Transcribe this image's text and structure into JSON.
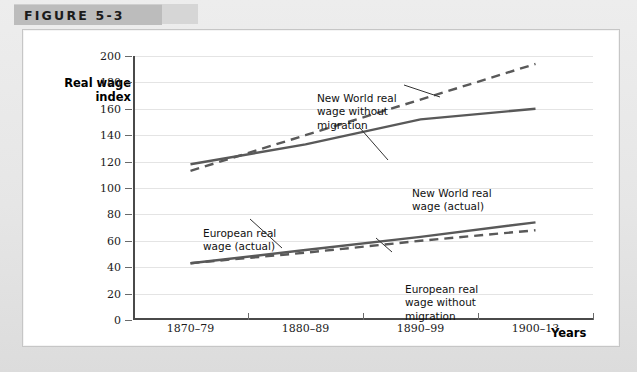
{
  "figure": {
    "label": "FIGURE 5-3"
  },
  "chart_data": {
    "type": "line",
    "title": "",
    "xlabel": "Years",
    "ylabel": "Real wage index",
    "ylabel_line1": "Real wage",
    "ylabel_line2": "index",
    "categories": [
      "1870–79",
      "1880–89",
      "1890–99",
      "1900–13"
    ],
    "ylim": [
      0,
      200
    ],
    "yticks": [
      0,
      20,
      40,
      60,
      80,
      100,
      120,
      140,
      160,
      180,
      200
    ],
    "grid": true,
    "legend": "annotations",
    "series": [
      {
        "name": "New World real wage without migration",
        "style": "dashed",
        "color": "#595959",
        "values": [
          113,
          140,
          167,
          194
        ]
      },
      {
        "name": "New World real wage (actual)",
        "style": "solid",
        "color": "#595959",
        "values": [
          118,
          133,
          152,
          160
        ]
      },
      {
        "name": "European real wage (actual)",
        "style": "solid",
        "color": "#595959",
        "values": [
          43,
          53,
          63,
          74
        ]
      },
      {
        "name": "European real wage without migration",
        "style": "dashed",
        "color": "#595959",
        "values": [
          43,
          51,
          60,
          68
        ]
      }
    ],
    "annotations": [
      {
        "id": "new-world-without-migration",
        "text": "New World real\nwage without\nmigration"
      },
      {
        "id": "new-world-actual",
        "text": "New World real\nwage (actual)"
      },
      {
        "id": "european-actual",
        "text": "European real\nwage (actual)"
      },
      {
        "id": "european-without-migration",
        "text": "European real\nwage without\nmigration"
      }
    ]
  },
  "colors": {
    "line": "#595959",
    "axis": "#4a4a4a",
    "grid": "#e4e4e4",
    "header_bar": "#bcbcbc",
    "page_bg": "#e8e8e8",
    "card_bg": "#ffffff"
  }
}
